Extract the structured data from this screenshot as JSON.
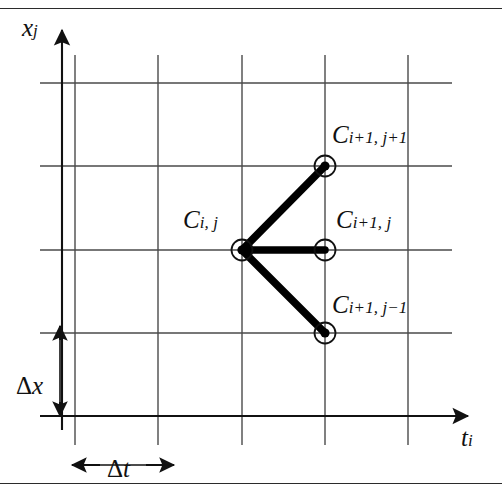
{
  "figure": {
    "name": "explicit-finite-difference-stencil",
    "colors": {
      "ink": "#1a1a1a",
      "grid": "#4a4a4a",
      "stencil": "#000000",
      "background": "#ffffff"
    }
  },
  "axes": {
    "vertical": {
      "symbol": "x",
      "subscript": "j"
    },
    "horizontal": {
      "symbol": "t",
      "subscript": "i"
    }
  },
  "grid": {
    "x_lines": [
      75,
      158,
      242,
      325,
      408
    ],
    "y_lines": [
      83,
      166,
      250,
      333,
      416
    ],
    "columns": 4,
    "rows": 4
  },
  "nodes": [
    {
      "id": "c-ij",
      "symbol": "C",
      "sub_base": "i",
      "sub_op1": "",
      "sub_rest": ", j",
      "x": 242,
      "y": 250,
      "filled": true,
      "label_full": "C i, j"
    },
    {
      "id": "c-i1j1",
      "symbol": "C",
      "sub_base": "i",
      "sub_op1": "+",
      "sub_rest": "1, j",
      "x": 325,
      "y": 166,
      "filled": true,
      "label_full": "C i+1, j+1",
      "tail_op": "+",
      "tail_num": "1"
    },
    {
      "id": "c-i1j",
      "symbol": "C",
      "sub_base": "i",
      "sub_op1": "+",
      "sub_rest": "1, j",
      "x": 325,
      "y": 250,
      "filled": false,
      "label_full": "C i+1, j"
    },
    {
      "id": "c-i1jm1",
      "symbol": "C",
      "sub_base": "i",
      "sub_op1": "+",
      "sub_rest": "1, j",
      "x": 325,
      "y": 333,
      "filled": true,
      "label_full": "C i+1, j-1",
      "tail_op": "−",
      "tail_num": "1"
    }
  ],
  "labels": {
    "c_ij": {
      "sym": "C",
      "sub": "i, j"
    },
    "c_i1j1": {
      "sym": "C",
      "sub": "i+1, j+1"
    },
    "c_i1j": {
      "sym": "C",
      "sub": "i+1, j"
    },
    "c_i1jm1": {
      "sym": "C",
      "sub": "i+1, j−1"
    },
    "x_axis": {
      "sym": "x",
      "sub": "j"
    },
    "t_axis": {
      "sym": "t",
      "sub": "i"
    },
    "delta_x": {
      "op": "Δ",
      "sym": "x"
    },
    "delta_t": {
      "op": "Δ",
      "sym": "t"
    }
  },
  "connections": [
    {
      "from": "c-ij",
      "to": "c-i1j1"
    },
    {
      "from": "c-ij",
      "to": "c-i1j"
    },
    {
      "from": "c-ij",
      "to": "c-i1jm1"
    }
  ],
  "dimension_arrows": [
    {
      "name": "delta-x-arrow",
      "orientation": "vertical",
      "x": 60,
      "y1": 327,
      "y2": 416
    },
    {
      "name": "delta-t-arrow",
      "orientation": "horizontal",
      "y": 465,
      "x1": 70,
      "x2": 172
    }
  ]
}
